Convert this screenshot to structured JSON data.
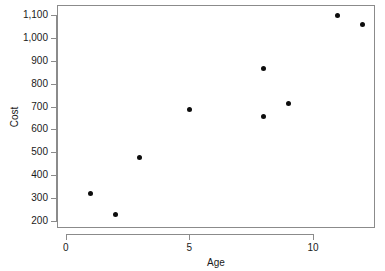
{
  "chart_data": {
    "type": "scatter",
    "title": "",
    "xlabel": "Age",
    "ylabel": "Cost",
    "xlim": [
      -0.35,
      12.5
    ],
    "ylim": [
      168,
      1145
    ],
    "grid": false,
    "legend": null,
    "xticks": [
      {
        "value": 0,
        "label": "0"
      },
      {
        "value": 5,
        "label": "5"
      },
      {
        "value": 10,
        "label": "10"
      }
    ],
    "yticks": [
      {
        "value": 200,
        "label": "200"
      },
      {
        "value": 300,
        "label": "300"
      },
      {
        "value": 400,
        "label": "400"
      },
      {
        "value": 500,
        "label": "500"
      },
      {
        "value": 600,
        "label": "600"
      },
      {
        "value": 700,
        "label": "700"
      },
      {
        "value": 800,
        "label": "800"
      },
      {
        "value": 900,
        "label": "900"
      },
      {
        "value": 1000,
        "label": "1,000"
      },
      {
        "value": 1100,
        "label": "1,100"
      }
    ],
    "series": [
      {
        "name": "Cost vs Age",
        "marker": "filled-circle",
        "color": "#0d0d0d",
        "points": [
          {
            "x": 1,
            "y": 320
          },
          {
            "x": 2,
            "y": 228
          },
          {
            "x": 3,
            "y": 475
          },
          {
            "x": 5,
            "y": 688
          },
          {
            "x": 8,
            "y": 868
          },
          {
            "x": 8,
            "y": 655
          },
          {
            "x": 9,
            "y": 714
          },
          {
            "x": 11,
            "y": 1100
          },
          {
            "x": 12,
            "y": 1060
          }
        ]
      }
    ]
  },
  "style": {
    "axis_color": "#8b8b8b",
    "point_color": "#0d0d0d",
    "text_color": "#1a1a1a",
    "background": "#ffffff"
  }
}
